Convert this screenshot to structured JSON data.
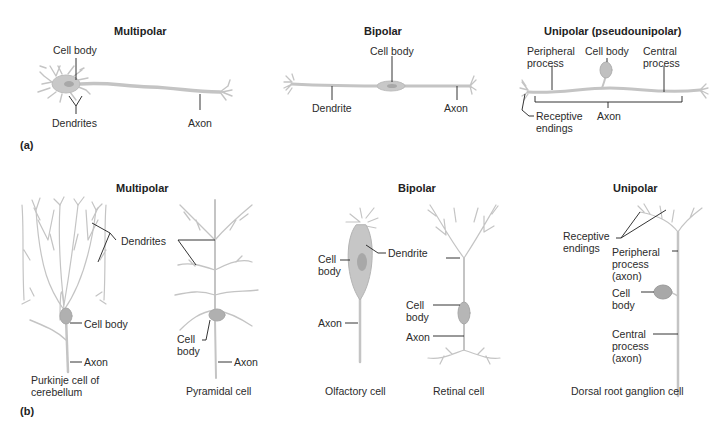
{
  "panel_a": {
    "label": "(a)",
    "multipolar": {
      "title": "Multipolar",
      "cell_body": "Cell body",
      "dendrites": "Dendrites",
      "axon": "Axon"
    },
    "bipolar": {
      "title": "Bipolar",
      "cell_body": "Cell body",
      "dendrite": "Dendrite",
      "axon": "Axon"
    },
    "unipolar": {
      "title": "Unipolar (pseudounipolar)",
      "peripheral_process": [
        "Peripheral",
        "process"
      ],
      "cell_body": "Cell body",
      "central_process": [
        "Central",
        "process"
      ],
      "receptive_endings": [
        "Receptive",
        "endings"
      ],
      "axon": "Axon"
    }
  },
  "panel_b": {
    "label": "(b)",
    "multipolar": {
      "title": "Multipolar",
      "dendrites": "Dendrites",
      "purkinje": {
        "cell_body": "Cell body",
        "axon": "Axon",
        "caption": [
          "Purkinje cell of",
          "cerebellum"
        ]
      },
      "pyramidal": {
        "cell_body": [
          "Cell",
          "body"
        ],
        "axon": "Axon",
        "caption": "Pyramidal cell"
      }
    },
    "bipolar": {
      "title": "Bipolar",
      "dendrite": "Dendrite",
      "olfactory": {
        "cell_body": [
          "Cell",
          "body"
        ],
        "axon": "Axon",
        "caption": "Olfactory cell"
      },
      "retinal": {
        "cell_body": [
          "Cell",
          "body"
        ],
        "axon": "Axon",
        "caption": "Retinal cell"
      }
    },
    "unipolar": {
      "title": "Unipolar",
      "receptive_endings": [
        "Receptive",
        "endings"
      ],
      "peripheral_process": [
        "Peripheral",
        "process",
        "(axon)"
      ],
      "cell_body": [
        "Cell",
        "body"
      ],
      "central_process": [
        "Central",
        "process",
        "(axon)"
      ],
      "caption": "Dorsal root ganglion cell"
    }
  },
  "colors": {
    "neuron_fill": "#c9c9c9",
    "neuron_stroke": "#b5b5b5",
    "soma": "#a9a9a9",
    "leader": "#1e1e1e",
    "text": "#2b2b2b"
  }
}
